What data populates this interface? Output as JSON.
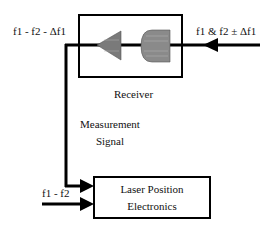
{
  "diagram": {
    "receiver": {
      "label": "Receiver"
    },
    "electronics": {
      "label_line1": "Laser Position",
      "label_line2": "Electronics"
    },
    "signals": {
      "incoming_beam": "f1 & f2 ± Δf1",
      "returned_beam": "f1 - f2 - Δf1",
      "measurement_line1": "Measurement",
      "measurement_line2": "Signal",
      "reference": "f1 - f2"
    },
    "colors": {
      "line": "#000000",
      "optic_fill": "#7a7a7a",
      "background": "#ffffff"
    }
  }
}
